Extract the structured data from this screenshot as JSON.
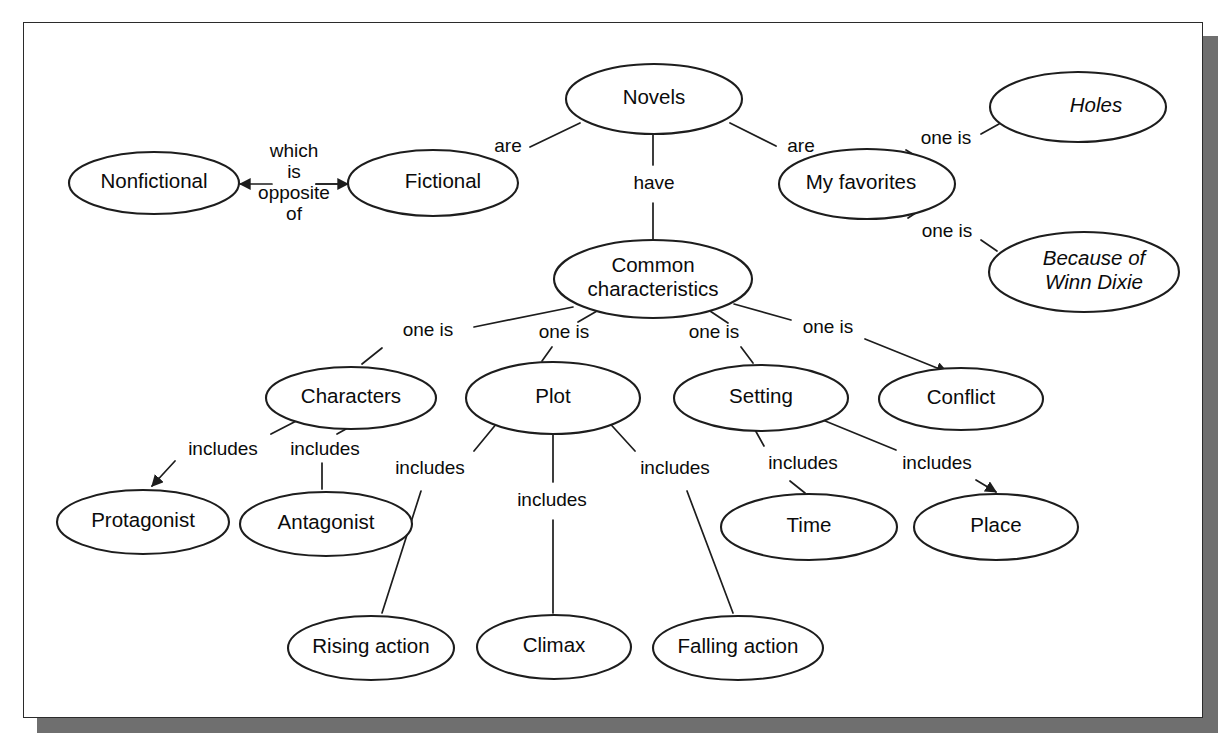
{
  "diagram": {
    "type": "concept-map",
    "frame": {
      "border_color": "#2b2b2b",
      "shadow_color": "#6f6f6f",
      "background": "#ffffff"
    },
    "nodes": [
      {
        "id": "novels",
        "label": "Novels",
        "cx": 630,
        "cy": 76,
        "rx": 88,
        "ry": 35,
        "italic": false,
        "lines": [
          "Novels"
        ],
        "text_dx": 0
      },
      {
        "id": "fictional",
        "label": "Fictional",
        "cx": 409,
        "cy": 160,
        "rx": 85,
        "ry": 33,
        "italic": false,
        "lines": [
          "Fictional"
        ],
        "text_dx": 10
      },
      {
        "id": "nonfictional",
        "label": "Nonfictional",
        "cx": 130,
        "cy": 160,
        "rx": 85,
        "ry": 31,
        "italic": false,
        "lines": [
          "Nonfictional"
        ],
        "text_dx": 0
      },
      {
        "id": "myfavorites",
        "label": "My favorites",
        "cx": 843,
        "cy": 161,
        "rx": 88,
        "ry": 35,
        "italic": false,
        "lines": [
          "My favorites"
        ],
        "text_dx": -6
      },
      {
        "id": "holes",
        "label": "Holes",
        "cx": 1054,
        "cy": 84,
        "rx": 88,
        "ry": 35,
        "italic": true,
        "lines": [
          "Holes"
        ],
        "text_dx": 18
      },
      {
        "id": "winndixie",
        "label": "Because of Winn Dixie",
        "cx": 1060,
        "cy": 249,
        "rx": 95,
        "ry": 40,
        "italic": true,
        "lines": [
          "Because of",
          "Winn Dixie"
        ],
        "text_dx": 10
      },
      {
        "id": "common",
        "label": "Common characteristics",
        "cx": 629,
        "cy": 256,
        "rx": 99,
        "ry": 39,
        "italic": false,
        "lines": [
          "Common",
          "characteristics"
        ],
        "text_dx": 0
      },
      {
        "id": "characters",
        "label": "Characters",
        "cx": 327,
        "cy": 375,
        "rx": 85,
        "ry": 31,
        "italic": false,
        "lines": [
          "Characters"
        ],
        "text_dx": 0
      },
      {
        "id": "plot",
        "label": "Plot",
        "cx": 529,
        "cy": 375,
        "rx": 87,
        "ry": 36,
        "italic": false,
        "lines": [
          "Plot"
        ],
        "text_dx": 0
      },
      {
        "id": "setting",
        "label": "Setting",
        "cx": 737,
        "cy": 375,
        "rx": 87,
        "ry": 33,
        "italic": false,
        "lines": [
          "Setting"
        ],
        "text_dx": 0
      },
      {
        "id": "conflict",
        "label": "Conflict",
        "cx": 937,
        "cy": 376,
        "rx": 82,
        "ry": 31,
        "italic": false,
        "lines": [
          "Conflict"
        ],
        "text_dx": 0
      },
      {
        "id": "protagonist",
        "label": "Protagonist",
        "cx": 119,
        "cy": 499,
        "rx": 86,
        "ry": 32,
        "italic": false,
        "lines": [
          "Protagonist"
        ],
        "text_dx": 0
      },
      {
        "id": "antagonist",
        "label": "Antagonist",
        "cx": 302,
        "cy": 501,
        "rx": 86,
        "ry": 32,
        "italic": false,
        "lines": [
          "Antagonist"
        ],
        "text_dx": 0
      },
      {
        "id": "time",
        "label": "Time",
        "cx": 785,
        "cy": 504,
        "rx": 88,
        "ry": 33,
        "italic": false,
        "lines": [
          "Time"
        ],
        "text_dx": 0
      },
      {
        "id": "place",
        "label": "Place",
        "cx": 972,
        "cy": 504,
        "rx": 82,
        "ry": 33,
        "italic": false,
        "lines": [
          "Place"
        ],
        "text_dx": 0
      },
      {
        "id": "risingaction",
        "label": "Rising action",
        "cx": 347,
        "cy": 625,
        "rx": 83,
        "ry": 32,
        "italic": false,
        "lines": [
          "Rising action"
        ],
        "text_dx": 0
      },
      {
        "id": "climax",
        "label": "Climax",
        "cx": 530,
        "cy": 624,
        "rx": 77,
        "ry": 32,
        "italic": false,
        "lines": [
          "Climax"
        ],
        "text_dx": 0
      },
      {
        "id": "fallingaction",
        "label": "Falling action",
        "cx": 714,
        "cy": 625,
        "rx": 85,
        "ry": 32,
        "italic": false,
        "lines": [
          "Falling action"
        ],
        "text_dx": 0
      }
    ],
    "edges": [
      {
        "id": "e-novels-fictional",
        "from": "novels",
        "to": "fictional",
        "label": "are",
        "label_x": 484,
        "label_y": 124,
        "path": "M 556 100 L 506 124 M 462 145 L 443 152",
        "arrow": false
      },
      {
        "id": "e-novels-myfavorites",
        "from": "novels",
        "to": "myfavorites",
        "label": "are",
        "label_x": 777,
        "label_y": 124,
        "path": "M 706 100 L 752 123 M 800 141 L 812 147",
        "arrow": false
      },
      {
        "id": "e-novels-common",
        "from": "novels",
        "to": "common",
        "label": "have",
        "label_x": 630,
        "label_y": 161,
        "path": "M 629 112 L 629 142 M 629 180 L 629 218",
        "arrow": false
      },
      {
        "id": "e-nonfictional-fictional",
        "from": "nonfictional",
        "to": "fictional",
        "label": "which\nis\nopposite\nof",
        "label_x": 270,
        "label_y": 160,
        "path": "",
        "arrow": true,
        "double_arrow": true,
        "arrow_y": 161,
        "arrow_x1": 216,
        "arrow_x2": 324,
        "label_lines": [
          "which",
          "is",
          "opposite",
          "of"
        ]
      },
      {
        "id": "e-myfav-holes",
        "from": "myfavorites",
        "to": "holes",
        "label": "one is",
        "label_x": 922,
        "label_y": 116,
        "path": "M 902 139 L 882 127 M 957 111 L 975 101",
        "arrow": false
      },
      {
        "id": "e-myfav-winndixie",
        "from": "myfavorites",
        "to": "winndixie",
        "label": "one is",
        "label_x": 923,
        "label_y": 209,
        "path": "M 901 184 L 884 195 M 957 217 L 973 228",
        "arrow": false
      },
      {
        "id": "e-common-characters",
        "from": "common",
        "to": "characters",
        "label": "one is",
        "label_x": 404,
        "label_y": 308,
        "path": "M 549 284 L 450 304 M 358 325 L 338 341",
        "arrow": false
      },
      {
        "id": "e-common-plot",
        "from": "common",
        "to": "plot",
        "label": "one is",
        "label_x": 540,
        "label_y": 310,
        "path": "M 573 288 L 554 299 M 528 324 L 518 338",
        "arrow": false
      },
      {
        "id": "e-common-setting",
        "from": "common",
        "to": "setting",
        "label": "one is",
        "label_x": 690,
        "label_y": 310,
        "path": "M 686 288 L 704 300 M 717 324 L 729 340",
        "arrow": false
      },
      {
        "id": "e-common-conflict",
        "from": "common",
        "to": "conflict",
        "label": "one is",
        "label_x": 804,
        "label_y": 305,
        "path": "M 710 281 L 767 297 M 841 316 L 923 349",
        "arrow": true,
        "arrow_end_x": 926,
        "arrow_end_y": 350
      },
      {
        "id": "e-characters-protagonist",
        "from": "characters",
        "to": "protagonist",
        "label": "includes",
        "label_x": 199,
        "label_y": 427,
        "path": "M 280 394 L 247 411 M 151 438 L 128 463",
        "arrow": true,
        "arrow_end_x": 131,
        "arrow_end_y": 461
      },
      {
        "id": "e-characters-antagonist",
        "from": "characters",
        "to": "antagonist",
        "label": "includes",
        "label_x": 301,
        "label_y": 427,
        "path": "M 322 406 L 313 411 M 298 440 L 298 466",
        "arrow": false
      },
      {
        "id": "e-plot-rising",
        "from": "plot",
        "to": "risingaction",
        "label": "includes",
        "label_x": 406,
        "label_y": 446,
        "path": "M 478 394 L 450 428 M 397 468 L 358 590",
        "arrow": false
      },
      {
        "id": "e-plot-climax",
        "from": "plot",
        "to": "climax",
        "label": "includes",
        "label_x": 528,
        "label_y": 478,
        "path": "M 529 411 L 529 459 M 529 497 L 529 590",
        "arrow": false
      },
      {
        "id": "e-plot-falling",
        "from": "plot",
        "to": "fallingaction",
        "label": "includes",
        "label_x": 651,
        "label_y": 446,
        "path": "M 580 394 L 611 428 M 663 468 L 709 590",
        "arrow": false
      },
      {
        "id": "e-setting-time",
        "from": "setting",
        "to": "time",
        "label": "includes",
        "label_x": 779,
        "label_y": 441,
        "path": "M 730 405 L 740 423 M 766 458 L 781 470",
        "arrow": false
      },
      {
        "id": "e-setting-place",
        "from": "setting",
        "to": "place",
        "label": "includes",
        "label_x": 913,
        "label_y": 441,
        "path": "M 789 393 L 872 427 M 952 457 L 972 469",
        "arrow": true,
        "arrow_end_x": 974,
        "arrow_end_y": 470
      }
    ]
  }
}
